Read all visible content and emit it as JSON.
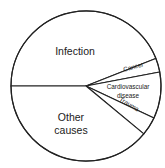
{
  "chart_data": {
    "type": "pie",
    "title": "",
    "start": "left-horizontal",
    "direction": "clockwise",
    "slices": [
      {
        "label": "Infection",
        "label_lines": [
          "Infection"
        ],
        "value": 44
      },
      {
        "label": "Cancer",
        "label_lines": [
          "Cancer"
        ],
        "value": 3
      },
      {
        "label": "Cardiovascular disease",
        "label_lines": [
          "Cardiovascular",
          "disease"
        ],
        "value": 10
      },
      {
        "label": "Trauma",
        "label_lines": [
          "Trauma"
        ],
        "value": 4
      },
      {
        "label": "Other causes",
        "label_lines": [
          "Other",
          "causes"
        ],
        "value": 39
      }
    ],
    "units": "percent (estimated from slice angles)",
    "fill_color": "#ffffff",
    "line_color": "#222222",
    "text_color": "#1a1a1a",
    "legend": "none (labels inside slices)"
  }
}
